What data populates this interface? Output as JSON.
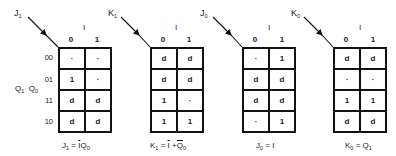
{
  "diagram": {
    "type": "karnaugh-maps",
    "row_variable_label": "Q1 Q0",
    "row_variable_parts": [
      "Q",
      "1",
      "Q",
      "0"
    ],
    "column_variable": "I",
    "column_values": [
      "0",
      "1"
    ],
    "row_values": [
      "00",
      "01",
      "11",
      "10"
    ],
    "maps": [
      {
        "name": "J1",
        "label_main": "J",
        "label_sub": "1",
        "cells": [
          [
            "·",
            "·"
          ],
          [
            "1",
            "·"
          ],
          [
            "d",
            "d"
          ],
          [
            "d",
            "d"
          ]
        ],
        "formula": {
          "lhs_main": "J",
          "lhs_sub": "1",
          "eq": " = ",
          "rhs_parts": [
            {
              "t": "I",
              "bar": true
            },
            {
              "t": " Q",
              "bar": false
            },
            {
              "t": "0",
              "sub": true
            }
          ]
        },
        "formula_text": "J1 = Ī Q0"
      },
      {
        "name": "K1",
        "label_main": "K",
        "label_sub": "1",
        "cells": [
          [
            "d",
            "d"
          ],
          [
            "d",
            "d"
          ],
          [
            "1",
            "·"
          ],
          [
            "1",
            "1"
          ]
        ],
        "formula_text": "K1 = Ī + Q̄0"
      },
      {
        "name": "J0",
        "label_main": "J",
        "label_sub": "0",
        "cells": [
          [
            "·",
            "1"
          ],
          [
            "d",
            "d"
          ],
          [
            "d",
            "d"
          ],
          [
            "·",
            "1"
          ]
        ],
        "formula_text": "J0 = I"
      },
      {
        "name": "K0",
        "label_main": "K",
        "label_sub": "0",
        "cells": [
          [
            "d",
            "d"
          ],
          [
            "·",
            "·"
          ],
          [
            "1",
            "1"
          ],
          [
            "d",
            "d"
          ]
        ],
        "formula_text": "K0 = Q1"
      }
    ]
  },
  "text": {
    "J1_main": "J",
    "J1_sub": "1",
    "K1_main": "K",
    "K1_sub": "1",
    "J0_main": "J",
    "J0_sub": "0",
    "K0_main": "K",
    "K0_sub": "0",
    "col_var": "I",
    "col0": "0",
    "col1": "1",
    "r0": "00",
    "r1": "01",
    "r2": "11",
    "r3": "10",
    "rowvar_q": "Q",
    "rowvar_1": "1",
    "rowvar_0": "0",
    "f_J1_lhs": "J",
    "f_J1_lhs_sub": "1",
    "f_eq": "=",
    "f_J1_I": "I",
    "f_J1_Q": "Q",
    "f_J1_Qsub": "0",
    "f_K1_lhs": "K",
    "f_K1_lhs_sub": "1",
    "f_K1_I": "I",
    "f_plus": "+",
    "f_K1_Q": "Q",
    "f_K1_Qsub": "0",
    "f_J0_lhs": "J",
    "f_J0_lhs_sub": "0",
    "f_J0_rhs": "I",
    "f_K0_lhs": "K",
    "f_K0_lhs_sub": "0",
    "f_K0_Q": "Q",
    "f_K0_Qsub": "1"
  }
}
